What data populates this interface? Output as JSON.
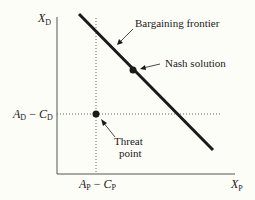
{
  "diagram": {
    "type": "bargaining-model",
    "axes": {
      "y_label": "X",
      "y_label_sub": "D",
      "x_label": "X",
      "x_label_sub": "P"
    },
    "tick_labels": {
      "y_tick": {
        "A": "A",
        "A_sub": "D",
        "minus": " − ",
        "C": "C",
        "C_sub": "D"
      },
      "x_tick": {
        "A": "A",
        "A_sub": "P",
        "minus": " − ",
        "C": "C",
        "C_sub": "P"
      }
    },
    "annotations": {
      "frontier": "Bargaining frontier",
      "nash": "Nash solution",
      "threat_line1": "Threat",
      "threat_line2": "point"
    },
    "colors": {
      "background": "#fdfdf8",
      "ink": "#1a1a1a",
      "axis": "#555555",
      "dotted": "#666666"
    }
  }
}
